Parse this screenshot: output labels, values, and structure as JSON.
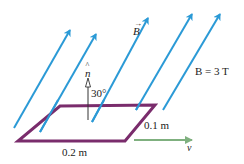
{
  "colors": {
    "field": "#2b9ad6",
    "loop": "#7a2c6c",
    "velocity": "#7fb07f",
    "normal": "#333333",
    "text": "#222222"
  },
  "labels": {
    "field_vector": "B",
    "field_vector_arrow": "→",
    "normal_vector": "n",
    "normal_hat": "^",
    "angle": "30°",
    "field_magnitude": "B = 3 T",
    "width": "0.1 m",
    "length": "0.2 m",
    "velocity": "v"
  },
  "field_lines": [
    {
      "x1": 14,
      "y1": 128,
      "x2": 70,
      "y2": 30
    },
    {
      "x1": 40,
      "y1": 132,
      "x2": 96,
      "y2": 34
    },
    {
      "x1": 92,
      "y1": 122,
      "x2": 148,
      "y2": 18
    },
    {
      "x1": 136,
      "y1": 110,
      "x2": 192,
      "y2": 14
    },
    {
      "x1": 163,
      "y1": 110,
      "x2": 220,
      "y2": 14
    }
  ]
}
